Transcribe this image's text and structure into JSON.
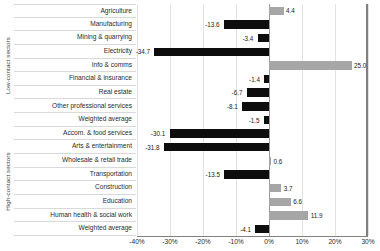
{
  "chart_data": {
    "type": "bar",
    "orientation": "horizontal",
    "title": "",
    "xlabel": "",
    "ylabel": "",
    "xlim": [
      -40,
      30
    ],
    "xticks": [
      "-40%",
      "-30%",
      "-20%",
      "-10%",
      "0%",
      "10%",
      "20%",
      "30%"
    ],
    "xtick_values": [
      -40,
      -30,
      -20,
      -10,
      0,
      10,
      20,
      30
    ],
    "grid": true,
    "legend": "none",
    "colors": {
      "negative": "#0d0d0d",
      "positive": "#a6a6a6",
      "gridline": "#e2e2e2",
      "axis": "#808080"
    },
    "group_labels": [
      "Low-contact sectors",
      "High-contact sectors"
    ],
    "categories": [
      "Agriculture",
      "Manufacturing",
      "Mining & quarrying",
      "Electricity",
      "Info & comms",
      "Financial & insurance",
      "Real estate",
      "Other professional services",
      "Weighted average",
      "Accom. & food services",
      "Arts & entertainment",
      "Wholesale & retail trade",
      "Transportation",
      "Construction",
      "Education",
      "Human health & social work",
      "Weighted average"
    ],
    "values": [
      4.4,
      -13.6,
      -3.4,
      -34.7,
      25.0,
      -1.4,
      -6.7,
      -8.1,
      -1.5,
      -30.1,
      -31.8,
      0.6,
      -13.5,
      3.7,
      6.6,
      11.9,
      -4.1
    ],
    "labels": [
      "4.4",
      "-13.6",
      "-3.4",
      "-34.7",
      "25.0",
      "-1.4",
      "-6.7",
      "-8.1",
      "-1.5",
      "-30.1",
      "-31.8",
      "0.6",
      "-13.5",
      "3.7",
      "6.6",
      "11.9",
      "-4.1"
    ],
    "groups": [
      {
        "label": "Low-contact sectors",
        "start": 0,
        "end": 8
      },
      {
        "label": "High-contact sectors",
        "start": 9,
        "end": 16
      }
    ]
  }
}
